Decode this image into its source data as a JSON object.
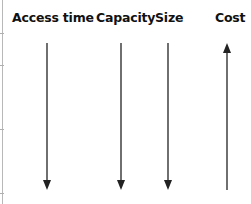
{
  "diagram": {
    "title": "",
    "columns": [
      {
        "label": "Access time",
        "direction": "down"
      },
      {
        "label": "Capacity",
        "direction": "down"
      },
      {
        "label": "Size",
        "direction": "down"
      },
      {
        "label": "Cost",
        "direction": "up"
      }
    ],
    "colors": {
      "arrow": "#222222",
      "text": "#111111",
      "rule": "#b8b8b8"
    }
  }
}
